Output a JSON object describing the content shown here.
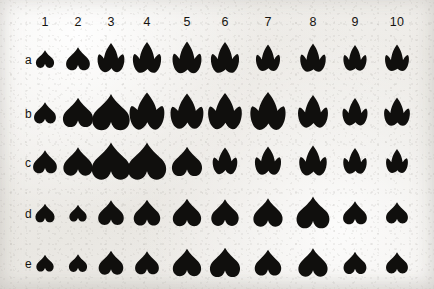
{
  "figure": {
    "kind": "leaf-silhouette-grid",
    "background_color": "#eeece8",
    "silhouette_color": "#100f0d",
    "rows": 5,
    "columns": 10
  },
  "column_headers": [
    "1",
    "2",
    "3",
    "4",
    "5",
    "6",
    "7",
    "8",
    "9",
    "10"
  ],
  "row_labels": [
    "a",
    "b",
    "c",
    "d",
    "e"
  ],
  "column_positions_px": [
    45,
    78,
    111,
    147,
    187,
    225,
    268,
    313,
    355,
    397
  ],
  "row_positions_px": [
    60,
    114,
    163,
    214,
    264
  ],
  "header_y_px": 16,
  "row_label_x_px": 25,
  "chart_data": {
    "type": "table",
    "title": "",
    "xlabel": "",
    "ylabel": "",
    "categories": [
      "1",
      "2",
      "3",
      "4",
      "5",
      "6",
      "7",
      "8",
      "9",
      "10"
    ],
    "series": [
      {
        "name": "a",
        "values": [
          20,
          26,
          34,
          36,
          37,
          36,
          31,
          33,
          30,
          31
        ],
        "lobes": [
          1,
          1,
          3,
          3,
          3,
          3,
          3,
          3,
          3,
          3
        ],
        "lobe_depth": [
          0.0,
          0.08,
          0.52,
          0.56,
          0.58,
          0.58,
          0.62,
          0.66,
          0.66,
          0.68
        ]
      },
      {
        "name": "b",
        "values": [
          24,
          33,
          41,
          43,
          41,
          42,
          44,
          38,
          32,
          33
        ],
        "lobes": [
          1,
          1,
          1,
          3,
          3,
          3,
          3,
          3,
          3,
          3
        ],
        "lobe_depth": [
          0.0,
          0.06,
          0.14,
          0.34,
          0.4,
          0.4,
          0.42,
          0.52,
          0.58,
          0.58
        ]
      },
      {
        "name": "c",
        "values": [
          26,
          32,
          42,
          42,
          33,
          31,
          33,
          35,
          30,
          28
        ],
        "lobes": [
          1,
          1,
          1,
          1,
          1,
          3,
          3,
          3,
          3,
          3
        ],
        "lobe_depth": [
          0.0,
          0.04,
          0.08,
          0.1,
          0.12,
          0.48,
          0.5,
          0.54,
          0.58,
          0.58
        ]
      },
      {
        "name": "d",
        "values": [
          21,
          19,
          28,
          29,
          31,
          30,
          32,
          36,
          26,
          24
        ],
        "lobes": [
          1,
          1,
          1,
          1,
          1,
          1,
          1,
          1,
          1,
          1
        ],
        "lobe_depth": [
          0,
          0,
          0,
          0,
          0,
          0,
          0,
          0,
          0,
          0
        ]
      },
      {
        "name": "e",
        "values": [
          19,
          20,
          27,
          26,
          31,
          33,
          29,
          32,
          25,
          24
        ],
        "lobes": [
          1,
          1,
          1,
          1,
          1,
          1,
          1,
          1,
          1,
          1
        ],
        "lobe_depth": [
          0,
          0,
          0,
          0,
          0,
          0,
          0,
          0,
          0,
          0
        ]
      }
    ],
    "legend_position": "none",
    "grid": false
  }
}
